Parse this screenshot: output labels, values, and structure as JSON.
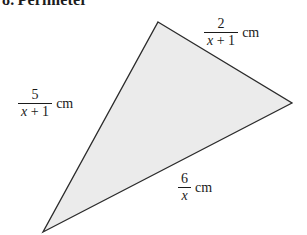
{
  "heading": {
    "number": "8.",
    "text": "Perimeter"
  },
  "figure": {
    "shape_name": "triangle",
    "fill_color": "#ebebeb",
    "stroke_color": "#2b2b2b",
    "stroke_width": 1.3,
    "background_color": "#ffffff",
    "vertices": [
      {
        "name": "top",
        "x": 158,
        "y": 22
      },
      {
        "name": "right",
        "x": 292,
        "y": 103
      },
      {
        "name": "bottom-left",
        "x": 43,
        "y": 232
      }
    ]
  },
  "labels": [
    {
      "id": "top",
      "side": "top-right-edge",
      "numerator": "2",
      "denominator_prefix": "x",
      "denominator_suffix": "+ 1",
      "unit": "cm",
      "full_text": "2/(x + 1) cm"
    },
    {
      "id": "left",
      "side": "left-edge",
      "numerator": "5",
      "denominator_prefix": "x",
      "denominator_suffix": "+ 1",
      "unit": "cm",
      "full_text": "5/(x + 1) cm"
    },
    {
      "id": "bottom",
      "side": "bottom-right-edge",
      "numerator": "6",
      "denominator_prefix": "x",
      "denominator_suffix": "",
      "unit": "cm",
      "full_text": "6/x cm"
    }
  ]
}
